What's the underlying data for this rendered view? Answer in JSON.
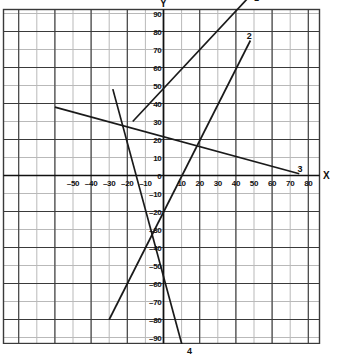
{
  "chart_data": {
    "type": "line",
    "title": "",
    "xlabel": "X",
    "ylabel": "Y",
    "xlim": [
      -80,
      90
    ],
    "ylim": [
      -100,
      105
    ],
    "grid": true,
    "grid_step_x": 10,
    "grid_step_y": 10,
    "legend": "inline-endpoint-labels",
    "xticks": [
      -50,
      -40,
      -30,
      -20,
      -10,
      0,
      10,
      20,
      30,
      40,
      50,
      60,
      70,
      80
    ],
    "xtick_labels": [
      "–50",
      "–40",
      "–30",
      "–20",
      "–10",
      "0",
      "10",
      "20",
      "30",
      "40",
      "50",
      "60",
      "70",
      "80"
    ],
    "yticks": [
      100,
      90,
      80,
      70,
      60,
      50,
      40,
      30,
      20,
      10,
      0,
      -10,
      -20,
      -30,
      -40,
      -50,
      -60,
      -70,
      -80,
      -90
    ],
    "ytick_labels": [
      "100",
      "90",
      "80",
      "70",
      "60",
      "50",
      "40",
      "30",
      "20",
      "10",
      "0",
      "–10",
      "–20",
      "–30",
      "–40",
      "–50",
      "–60",
      "–70",
      "–80",
      "–90"
    ],
    "series": [
      {
        "name": "1",
        "label": "1",
        "color": "#1a1a1a",
        "points": [
          [
            -17,
            30
          ],
          [
            48,
            100
          ]
        ],
        "label_pos": [
          50,
          101
        ]
      },
      {
        "name": "2",
        "label": "2",
        "color": "#1a1a1a",
        "points": [
          [
            -30,
            -80
          ],
          [
            48,
            75
          ]
        ],
        "label_pos": [
          46,
          80
        ]
      },
      {
        "name": "3",
        "label": "3",
        "color": "#1a1a1a",
        "points": [
          [
            -60,
            38
          ],
          [
            75,
            1
          ]
        ],
        "label_pos": [
          74,
          6
        ]
      },
      {
        "name": "4",
        "label": "4",
        "color": "#1a1a1a",
        "points": [
          [
            -28,
            48
          ],
          [
            11,
            -97
          ]
        ],
        "label_pos": [
          13,
          -95
        ]
      }
    ]
  },
  "axes": {
    "x_axis_label": "X",
    "y_axis_label": "Y"
  },
  "colors": {
    "grid_minor": "#b9b9b9",
    "grid_major": "#3a3a3a",
    "axis": "#111111",
    "line": "#1a1a1a",
    "background": "#ffffff"
  }
}
